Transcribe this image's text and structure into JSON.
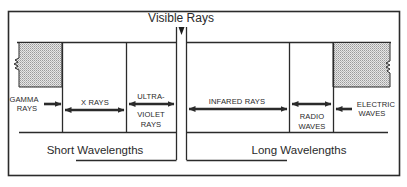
{
  "diagram": {
    "title": "Visible Rays",
    "regions": [
      {
        "id": "gamma",
        "lines": [
          "GAMMA",
          "RAYS"
        ]
      },
      {
        "id": "xray",
        "lines": [
          "X RAYS"
        ]
      },
      {
        "id": "ultraviolet",
        "lines": [
          "ULTRA-",
          "VIOLET",
          "RAYS"
        ]
      },
      {
        "id": "infrared",
        "lines": [
          "INFARED RAYS"
        ]
      },
      {
        "id": "radio",
        "lines": [
          "RADIO",
          "WAVES"
        ]
      },
      {
        "id": "electric",
        "lines": [
          "ELECTRIC",
          "WAVES"
        ]
      }
    ],
    "bottom_labels": {
      "short": "Short Wavelengths",
      "long": "Long Wavelengths"
    },
    "colors": {
      "ink": "#2b2b2b",
      "stipple": "#d8d8d8",
      "background": "#ffffff"
    }
  }
}
